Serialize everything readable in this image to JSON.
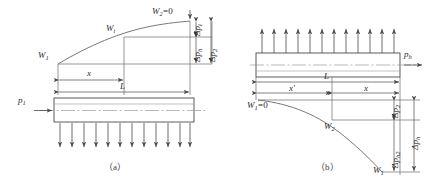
{
  "figure": {
    "caption_a": "（a）",
    "caption_b": "（b）",
    "panels": [
      {
        "id": "a",
        "caption": "（a）",
        "pressure_label": "p",
        "pressure_sub": "1",
        "curve_start_label": "W",
        "curve_start_sub": "1",
        "curve_mid_label": "W",
        "curve_mid_sub": "i",
        "curve_end_label": "W",
        "curve_end_sub": "2",
        "curve_end_value": "=0",
        "dim_x": "x",
        "dim_L": "L",
        "delta_top": "Δp",
        "delta_top_sub": "i",
        "delta_mid": "Δp",
        "delta_mid_sub": "h",
        "delta_right": "Δp",
        "delta_right_sub": "2",
        "load_arrow_count": 12,
        "load_direction": "down"
      },
      {
        "id": "b",
        "caption": "（b）",
        "pressure_label": "p",
        "pressure_sub": "h",
        "curve_start_label": "W",
        "curve_start_sub": "1",
        "curve_start_value": "=0",
        "curve_mid_label": "W",
        "curve_mid_sub": "2",
        "curve_end_label": "W",
        "curve_end_sub": "1",
        "dim_L": "L",
        "dim_xprime": "x'",
        "dim_x": "x",
        "delta_top": "Δp",
        "delta_top_sub": "2",
        "delta_mid": "Δp",
        "delta_mid_sub": "h2",
        "delta_right": "Δp",
        "delta_right_sub": "h",
        "load_arrow_count": 12,
        "load_direction": "up"
      }
    ]
  },
  "colors": {
    "line": "#4a4a4a",
    "text": "#2b2b2b",
    "background": "#ffffff",
    "centerline": "#8a8a8a"
  }
}
